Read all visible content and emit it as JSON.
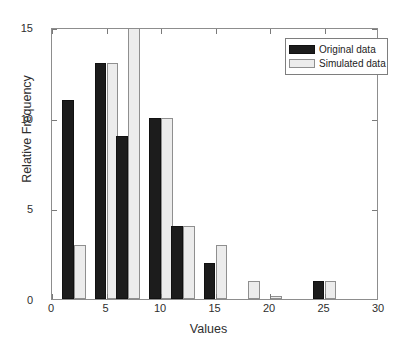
{
  "chart_data": {
    "type": "bar",
    "title": "",
    "xlabel": "Values",
    "ylabel": "Relative Frequency",
    "xlim": [
      0,
      30
    ],
    "ylim": [
      0,
      15
    ],
    "xticks": [
      "0",
      "5",
      "10",
      "15",
      "20",
      "25",
      "30"
    ],
    "yticks": [
      "0",
      "5",
      "10",
      "15"
    ],
    "xtick_values": [
      0,
      5,
      10,
      15,
      20,
      25,
      30
    ],
    "ytick_values": [
      0,
      5,
      10,
      15
    ],
    "grid": false,
    "legend_position": "upper right",
    "categories": [
      2,
      5,
      7,
      10,
      12,
      15,
      18,
      20,
      25
    ],
    "series": [
      {
        "name": "Original data",
        "color": "#1c1c1c",
        "values": [
          11,
          13,
          9,
          10,
          4,
          2,
          0,
          0,
          1
        ]
      },
      {
        "name": "Simulated data",
        "color": "#ececec",
        "values": [
          3,
          13,
          17,
          10,
          4,
          3,
          1,
          0.15,
          1
        ],
        "clipped": [
          false,
          false,
          true,
          false,
          false,
          false,
          false,
          false,
          false
        ]
      }
    ],
    "bar_width": 1.1
  },
  "legend": {
    "items": [
      {
        "label": "Original data",
        "swatch": "orig"
      },
      {
        "label": "Simulated data",
        "swatch": "sim"
      }
    ]
  }
}
